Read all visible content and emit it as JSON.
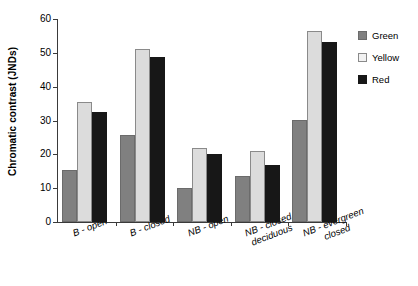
{
  "chart_data": {
    "type": "bar",
    "title": "",
    "xlabel": "",
    "ylabel": "Chromatic contrast (JNDs)",
    "ylim": [
      0,
      60
    ],
    "yticks": [
      0,
      10,
      20,
      30,
      40,
      50,
      60
    ],
    "ytick_labels": [
      "0",
      "10",
      "20",
      "30",
      "40",
      "50",
      "60"
    ],
    "grid": false,
    "legend_position": "right",
    "categories": [
      "B - open",
      "B - closed",
      "NB - open",
      "NB - closed deciduous",
      "NB - evergreen closed"
    ],
    "category_lines": [
      [
        "B - open",
        ""
      ],
      [
        "B - closed",
        ""
      ],
      [
        "NB - open",
        ""
      ],
      [
        "NB - closed",
        "deciduous"
      ],
      [
        "NB - evergreen",
        "closed"
      ]
    ],
    "series": [
      {
        "name": "Green",
        "color": "#808080",
        "values": [
          15.3,
          25.8,
          10.1,
          13.6,
          30.3
        ]
      },
      {
        "name": "Yellow",
        "color": "#dcdcdc",
        "values": [
          35.4,
          51.1,
          22.0,
          21.0,
          56.4
        ]
      },
      {
        "name": "Red",
        "color": "#171717",
        "values": [
          32.6,
          48.7,
          20.1,
          16.9,
          53.1
        ]
      }
    ]
  },
  "legend": {
    "items": [
      {
        "label": "Green"
      },
      {
        "label": "Yellow"
      },
      {
        "label": "Red"
      }
    ]
  }
}
